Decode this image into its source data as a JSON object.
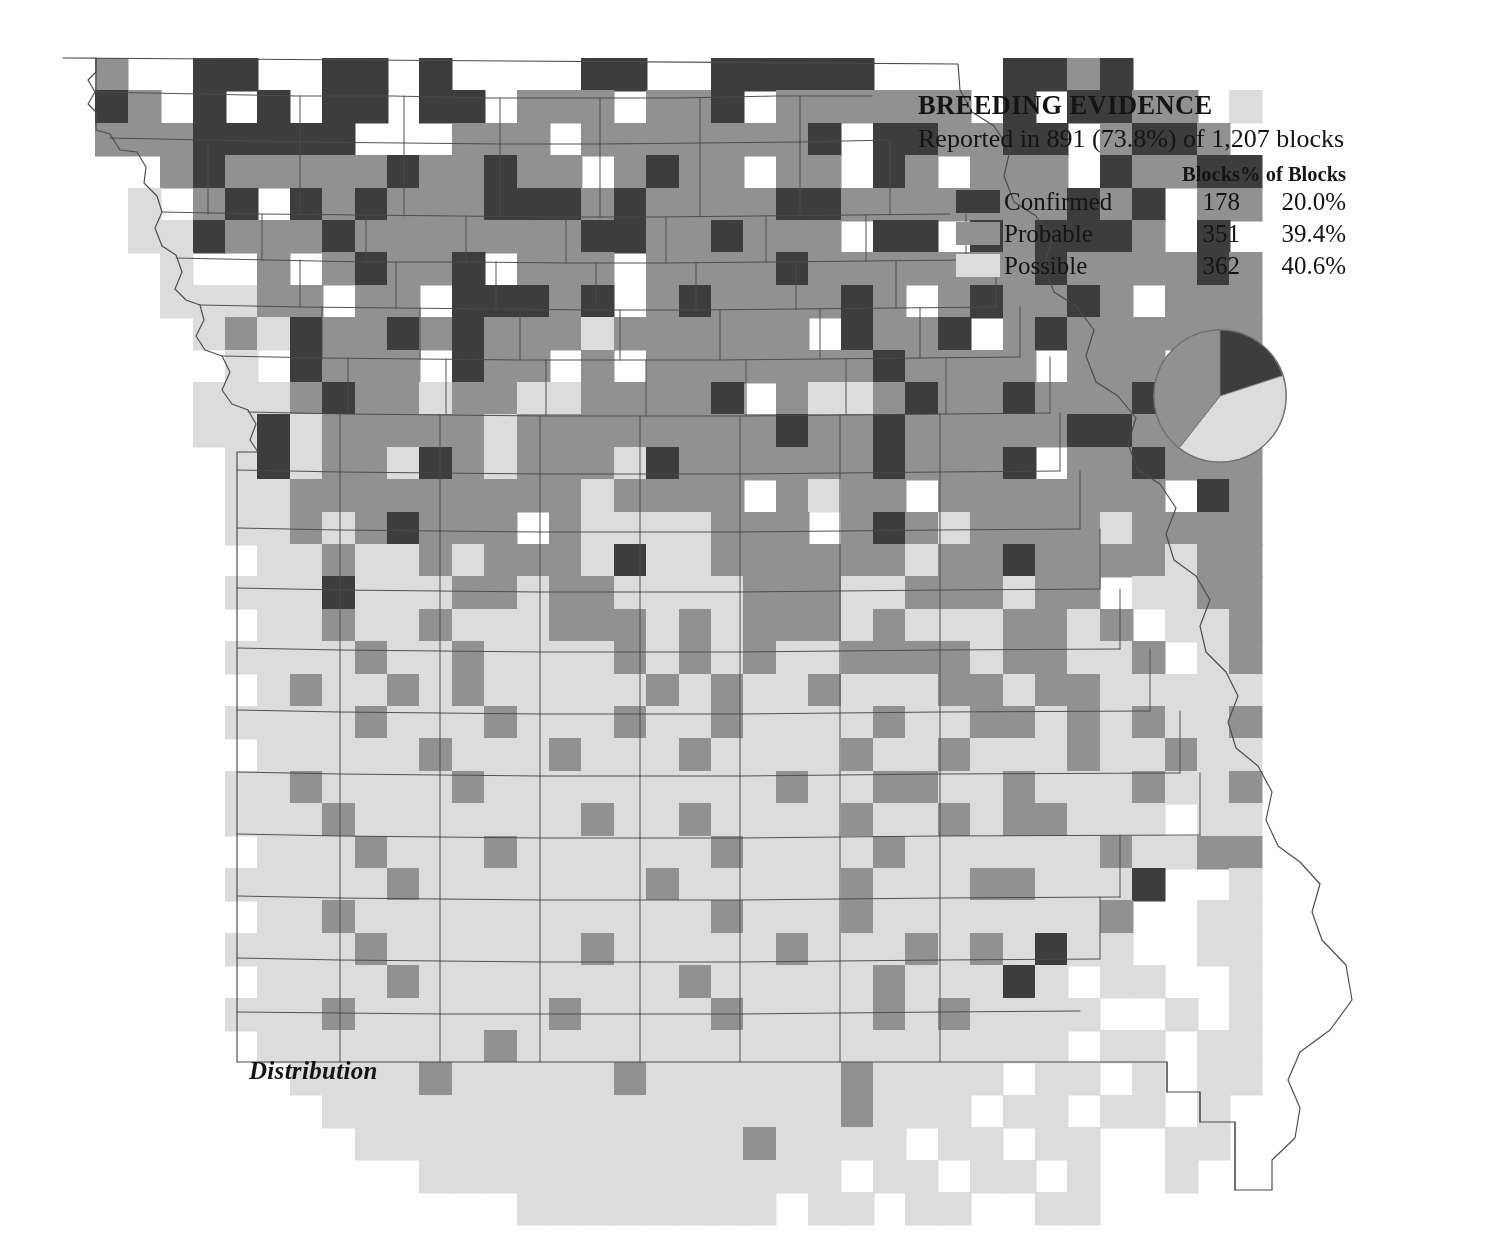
{
  "legend": {
    "title": "BREEDING EVIDENCE",
    "subtitle": "Reported in 891 (73.8%) of 1,207 blocks",
    "columns": {
      "spacer": "",
      "blocks": "Blocks",
      "percent": "% of Blocks"
    },
    "rows": [
      {
        "label": "Confirmed",
        "blocks": "178",
        "percent": "20.0%",
        "color": "#3d3d3d"
      },
      {
        "label": "Probable",
        "blocks": "351",
        "percent": "39.4%",
        "color": "#919191"
      },
      {
        "label": "Possible",
        "blocks": "362",
        "percent": "40.6%",
        "color": "#dcdcdc"
      }
    ]
  },
  "caption": {
    "text": "Distribution"
  },
  "chart_data": {
    "type": "pie",
    "title": "BREEDING EVIDENCE",
    "subtitle": "Reported in 891 (73.8%) of 1,207 blocks",
    "labels": [
      "Confirmed",
      "Probable",
      "Possible"
    ],
    "values": [
      178,
      351,
      362
    ],
    "percents": [
      20.0,
      39.4,
      40.6
    ],
    "colors": [
      "#3d3d3d",
      "#919191",
      "#dcdcdc"
    ],
    "total_reported_blocks": 891,
    "total_blocks": 1207,
    "reported_percent": 73.8,
    "start_angle_deg": 0,
    "direction": "clockwise",
    "legend_position": "above-left",
    "grid": false
  },
  "map": {
    "type": "grid-distribution-map",
    "region": "Missouri",
    "cell_px": 32.4,
    "origin": {
      "x": 63,
      "y": 58
    },
    "cols": 39,
    "rows": 36,
    "palette": {
      "0": "none",
      "1": "#dcdcdc",
      "2": "#919191",
      "3": "#3d3d3d"
    },
    "cells": [
      "0200330033030000330033333000033230000",
      "0320303033033022202230222222030332201",
      "0222333330002220222222230332233023320",
      "0002322222322322023220220320222032233",
      "0010230323222333232222332222222323022",
      "0011322232222222332232220330323332030",
      "0001002023223022202222322222223222232",
      "0001112202203332302322223202322320222",
      "0000121322323222122222203223023222222",
      "0000010322203220202222222322220222030",
      "0000111232212211222230211232232223222",
      "0000113122222122222222322322222332220",
      "0000013122132122213222222322230223222",
      "0000011222222222122220212202222222032",
      "0000011212322202111122202321222212222",
      "0000001121121222131122222212232222122",
      "0000011131112212211112221122212201122",
      "0000001121121112221212221211122120112",
      "0000011112112111121212112222122112012",
      "0000001211212111112121121112212211111",
      "0000011112111211121121111211221212112",
      "0000001111121112111211112112111211211",
      "0000011211112111111111211221121112112",
      "0000011121111111211211112112122111011",
      "0000001112111211111121111211111121122",
      "0000011111211111112111112111221113001",
      "0000001121111111111121112111111120011",
      "0000011112111111211111211121213110011",
      "0000001111211111111211111211131011001",
      "0000011121111112111121111212111100101",
      "0000001111111211111111111111111011011",
      "0000000111121111121111112111101101011",
      "0000000011111111111111112111011011010",
      "0000000001111111111112111101101100110",
      "0000000000011111111111110110110100100",
      "0000000000000011111111011011001100000"
    ]
  }
}
